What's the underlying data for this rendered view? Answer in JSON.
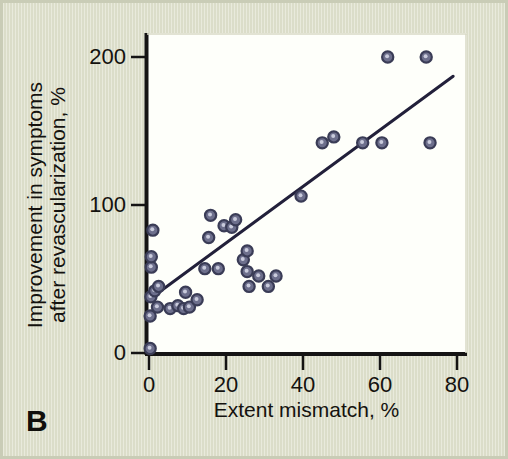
{
  "figure": {
    "panel_label": "B",
    "background_color": "#dfe1cd",
    "plot_background_color": "#fefffa",
    "marker_color": "#6d6f8c",
    "marker_edge_color": "#3a3c56",
    "line_color": "#22203a"
  },
  "chart_data": {
    "type": "scatter",
    "title": "",
    "xlabel": "Extent mismatch, %",
    "ylabel_line1": "Improvement in symptoms",
    "ylabel_line2": "after revascularization, %",
    "xlim": [
      0,
      80
    ],
    "ylim": [
      0,
      200
    ],
    "xticks": [
      0,
      20,
      40,
      60,
      80
    ],
    "xtick_labels": [
      "0",
      "20",
      "40",
      "60",
      "80"
    ],
    "yticks": [
      0,
      100,
      200
    ],
    "ytick_labels": [
      "0",
      "100",
      "200"
    ],
    "grid": false,
    "legend": null,
    "series": [
      {
        "name": "Patients",
        "marker": "circle",
        "points": [
          [
            0.3,
            3
          ],
          [
            0.3,
            25
          ],
          [
            0.5,
            38
          ],
          [
            1.0,
            83
          ],
          [
            0.6,
            58
          ],
          [
            0.6,
            65
          ],
          [
            1.5,
            42
          ],
          [
            2.5,
            45
          ],
          [
            2.2,
            31
          ],
          [
            5.5,
            30
          ],
          [
            7.5,
            32
          ],
          [
            9.0,
            30
          ],
          [
            10.5,
            31
          ],
          [
            9.5,
            41
          ],
          [
            12.5,
            36
          ],
          [
            14.5,
            57
          ],
          [
            15.5,
            78
          ],
          [
            16.0,
            93
          ],
          [
            18.0,
            57
          ],
          [
            19.5,
            86
          ],
          [
            21.5,
            85
          ],
          [
            22.5,
            90
          ],
          [
            24.5,
            63
          ],
          [
            25.5,
            69
          ],
          [
            25.5,
            55
          ],
          [
            26.0,
            45
          ],
          [
            28.5,
            52
          ],
          [
            31.0,
            45
          ],
          [
            33.0,
            52
          ],
          [
            39.5,
            106
          ],
          [
            45.0,
            142
          ],
          [
            48.0,
            146
          ],
          [
            55.5,
            142
          ],
          [
            60.5,
            142
          ],
          [
            62.0,
            200
          ],
          [
            72.0,
            200
          ],
          [
            73.0,
            142
          ]
        ]
      }
    ],
    "trendline": {
      "name": "regression line",
      "x_start": 1.0,
      "y_start": 38,
      "x_end": 79.0,
      "y_end": 187
    }
  }
}
